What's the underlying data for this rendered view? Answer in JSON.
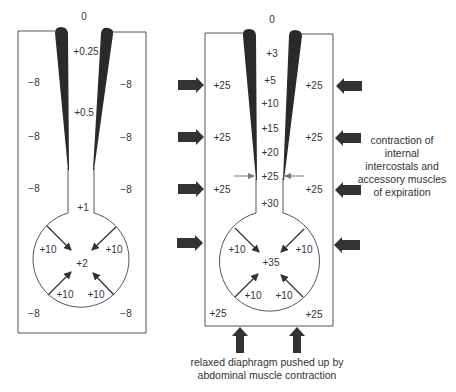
{
  "colors": {
    "outline": "#555555",
    "wedge": "#2a2a2a",
    "arrow": "#333333",
    "text": "#333333",
    "small_arrow": "#777777"
  },
  "left_diagram": {
    "top_label": "0",
    "airway_labels": [
      "+0.25",
      "+0.5",
      "+1"
    ],
    "pleural_labels": {
      "left": [
        "-8",
        "-8",
        "-8",
        "-8"
      ],
      "right": [
        "-8",
        "-8",
        "-8",
        "-8"
      ]
    },
    "alveolar_center": "+2",
    "recoil_labels": [
      "+10",
      "+10",
      "+10",
      "+10"
    ]
  },
  "right_diagram": {
    "top_label": "0",
    "airway_labels": [
      "+3",
      "+5",
      "+10",
      "+15",
      "+20",
      "+25",
      "+30"
    ],
    "pleural_labels": {
      "left": [
        "+25",
        "+25",
        "+25",
        "+25"
      ],
      "right": [
        "+25",
        "+25",
        "+25",
        "+25"
      ]
    },
    "alveolar_center": "+35",
    "recoil_labels": [
      "+10",
      "+10",
      "+10",
      "+10"
    ]
  },
  "annotations": {
    "expiration_muscles": [
      "contraction of",
      "internal",
      "intercostals and",
      "accessory muscles",
      "of expiration"
    ],
    "diaphragm": [
      "relaxed diaphragm pushed up by",
      "abdominal muscle contraction"
    ]
  }
}
